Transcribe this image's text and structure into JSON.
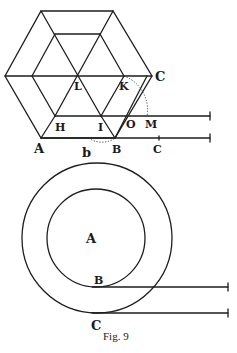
{
  "figure": {
    "caption": "Fig. 9",
    "hexagon": {
      "labels": {
        "A": "A",
        "B": "B",
        "C": "C",
        "b": "b",
        "c": "C",
        "H": "H",
        "I": "I",
        "K": "K",
        "L": "L",
        "M": "M",
        "O": "O"
      }
    },
    "circles": {
      "labels": {
        "A": "A",
        "B": "B",
        "C": "C"
      }
    }
  }
}
